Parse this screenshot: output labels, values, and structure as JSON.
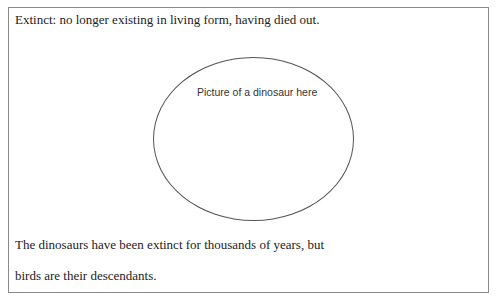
{
  "definition": {
    "text": "Extinct:  no longer existing in living form, having died out."
  },
  "picture": {
    "placeholder": "Picture of a dinosaur here"
  },
  "body": {
    "lines": [
      "The dinosaurs have been extinct for thousands of years, but",
      "birds are their descendants."
    ]
  }
}
